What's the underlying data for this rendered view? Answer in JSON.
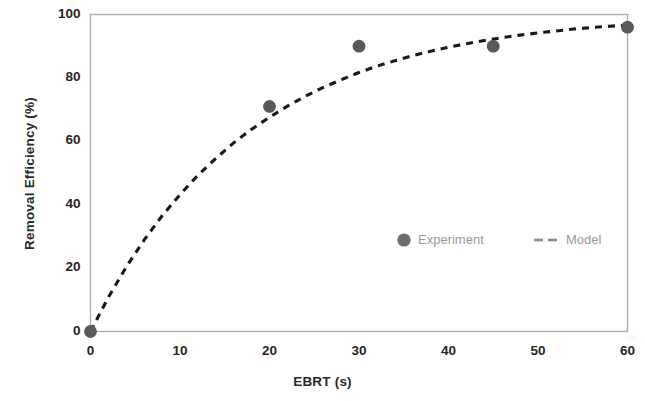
{
  "chart_data": {
    "type": "scatter",
    "title": "",
    "xlabel": "EBRT (s)",
    "ylabel": "Removal Efficiency (%)",
    "xlim": [
      0,
      60
    ],
    "ylim": [
      0,
      100
    ],
    "xticks": [
      "0",
      "10",
      "20",
      "30",
      "40",
      "50",
      "60"
    ],
    "yticks": [
      "0",
      "20",
      "40",
      "60",
      "80",
      "100"
    ],
    "grid": false,
    "legend_position": "inside-lower-right",
    "series": [
      {
        "name": "Experiment",
        "type": "scatter",
        "marker": "filled-circle",
        "color": "#595959",
        "x": [
          0,
          20,
          30,
          45,
          60
        ],
        "values": [
          0,
          71,
          90,
          90,
          96
        ]
      },
      {
        "name": "Model",
        "type": "line",
        "style": "dashed",
        "color": "#1a1a1a",
        "x": [
          0,
          2,
          4,
          6,
          8,
          10,
          12,
          14,
          16,
          18,
          20,
          22,
          24,
          26,
          28,
          30,
          32,
          34,
          36,
          38,
          40,
          42,
          44,
          46,
          48,
          50,
          52,
          54,
          56,
          58,
          60
        ],
        "values": [
          0,
          10.8,
          20.4,
          28.9,
          36.5,
          43.2,
          49.3,
          54.6,
          59.5,
          63.8,
          67.6,
          71.1,
          74.2,
          77.0,
          79.4,
          81.7,
          83.7,
          85.4,
          87.0,
          88.4,
          89.7,
          90.8,
          91.8,
          92.7,
          93.5,
          94.2,
          94.8,
          95.4,
          95.9,
          96.3,
          96.7
        ]
      }
    ],
    "legend": [
      {
        "label": "Experiment",
        "marker": "filled-circle",
        "color": "#595959"
      },
      {
        "label": "Model",
        "marker": "dashed-line",
        "color": "#3d3d3d"
      }
    ],
    "colors": {
      "marker": "#595959",
      "model_line": "#1a1a1a",
      "frame": "#b0b0b0",
      "tick_text": "#262626",
      "legend_text": "#9b9b9b",
      "background": "#ffffff"
    }
  }
}
